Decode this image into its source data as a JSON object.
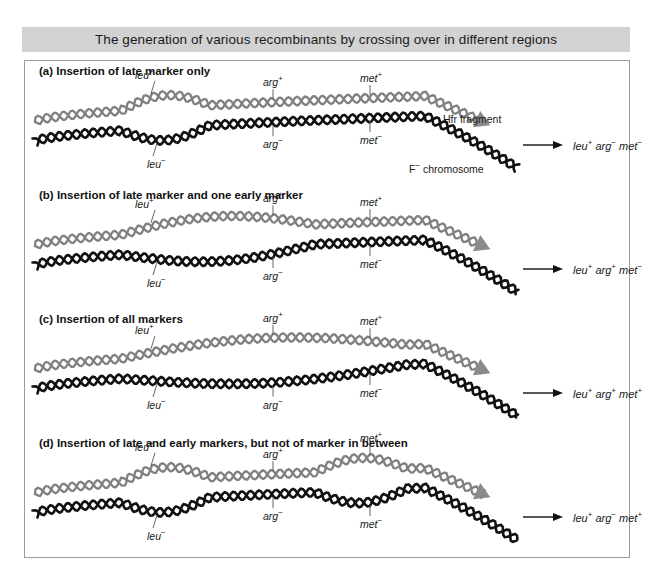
{
  "figure": {
    "title": "The generation of various recombinants by crossing over in different regions",
    "legend": {
      "hfr_fragment_label": "Hfr fragment",
      "f_minus_chromosome_label": "F⁻ chromosome"
    },
    "colors": {
      "title_bar_background": "#d2d2d2",
      "panel_background": "#ffffff",
      "panel_border": "#9a9a9a",
      "hfr_strand": "#808080",
      "f_minus_strand": "#111111",
      "arrowhead": "#8a8a8a",
      "text": "#1a1a1a"
    },
    "markers": {
      "hfr": [
        "leu",
        "arg",
        "met"
      ],
      "f_minus": [
        "leu",
        "arg",
        "met"
      ]
    },
    "panels": [
      {
        "id": "a",
        "heading": "(a) Insertion of late marker only",
        "hfr_labels": [
          {
            "gene": "leu",
            "sign": "+"
          },
          {
            "gene": "arg",
            "sign": "+"
          },
          {
            "gene": "met",
            "sign": "+"
          }
        ],
        "f_labels": [
          {
            "gene": "leu",
            "sign": "−"
          },
          {
            "gene": "arg",
            "sign": "−"
          },
          {
            "gene": "met",
            "sign": "−"
          }
        ],
        "crossovers": 2,
        "loops": [
          "leu"
        ],
        "result": [
          {
            "gene": "leu",
            "sign": "+"
          },
          {
            "gene": "arg",
            "sign": "−"
          },
          {
            "gene": "met",
            "sign": "−"
          }
        ],
        "result_text": "leu+ arg- met-"
      },
      {
        "id": "b",
        "heading": "(b) Insertion of late marker and one early marker",
        "hfr_labels": [
          {
            "gene": "leu",
            "sign": "+"
          },
          {
            "gene": "arg",
            "sign": "+"
          },
          {
            "gene": "met",
            "sign": "+"
          }
        ],
        "f_labels": [
          {
            "gene": "leu",
            "sign": "−"
          },
          {
            "gene": "arg",
            "sign": "−"
          },
          {
            "gene": "met",
            "sign": "−"
          }
        ],
        "crossovers": 2,
        "loops": [
          "leu",
          "arg"
        ],
        "result": [
          {
            "gene": "leu",
            "sign": "+"
          },
          {
            "gene": "arg",
            "sign": "+"
          },
          {
            "gene": "met",
            "sign": "−"
          }
        ],
        "result_text": "leu+ arg+ met-"
      },
      {
        "id": "c",
        "heading": "(c) Insertion of all markers",
        "hfr_labels": [
          {
            "gene": "leu",
            "sign": "+"
          },
          {
            "gene": "arg",
            "sign": "+"
          },
          {
            "gene": "met",
            "sign": "+"
          }
        ],
        "f_labels": [
          {
            "gene": "leu",
            "sign": "−"
          },
          {
            "gene": "arg",
            "sign": "−"
          },
          {
            "gene": "met",
            "sign": "−"
          }
        ],
        "crossovers": 2,
        "loops": [
          "leu",
          "arg",
          "met"
        ],
        "result": [
          {
            "gene": "leu",
            "sign": "+"
          },
          {
            "gene": "arg",
            "sign": "+"
          },
          {
            "gene": "met",
            "sign": "+"
          }
        ],
        "result_text": "leu+ arg+ met+"
      },
      {
        "id": "d",
        "heading": "(d) Insertion of late and early markers, but not of marker in between",
        "hfr_labels": [
          {
            "gene": "leu",
            "sign": "+"
          },
          {
            "gene": "arg",
            "sign": "+"
          },
          {
            "gene": "met",
            "sign": "+"
          }
        ],
        "f_labels": [
          {
            "gene": "leu",
            "sign": "−"
          },
          {
            "gene": "arg",
            "sign": "−"
          },
          {
            "gene": "met",
            "sign": "−"
          }
        ],
        "crossovers": 4,
        "loops": [
          "leu",
          "met"
        ],
        "result": [
          {
            "gene": "leu",
            "sign": "+"
          },
          {
            "gene": "arg",
            "sign": "−"
          },
          {
            "gene": "met",
            "sign": "+"
          }
        ],
        "result_text": "leu+ arg- met+"
      }
    ]
  }
}
